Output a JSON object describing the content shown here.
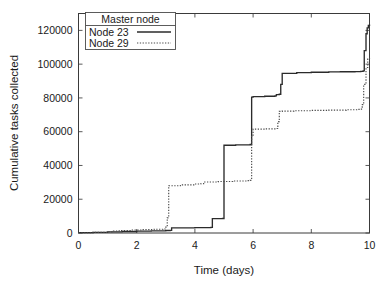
{
  "chart_data": {
    "type": "line",
    "title": "",
    "xlabel": "Time (days)",
    "ylabel": "Cumulative tasks collected",
    "xlim": [
      0,
      10
    ],
    "ylim": [
      0,
      130000
    ],
    "xticks": [
      0,
      2,
      4,
      6,
      8,
      10
    ],
    "xtick_labels": [
      "0",
      "2",
      "4",
      "6",
      "8",
      "10"
    ],
    "yticks": [
      0,
      20000,
      40000,
      60000,
      80000,
      100000,
      120000
    ],
    "ytick_labels": [
      "0",
      "20000",
      "40000",
      "60000",
      "80000",
      "100000",
      "120000"
    ],
    "grid": false,
    "step_style": "post",
    "legend": {
      "title": "Master node",
      "position": "upper-left-inside",
      "entries": [
        {
          "label": "Node 23",
          "style": "solid"
        },
        {
          "label": "Node 29",
          "style": "dotted"
        }
      ]
    },
    "series": [
      {
        "name": "Node 23",
        "style": "solid",
        "color": "#2b2b2b",
        "x": [
          0.0,
          0.5,
          1.0,
          1.5,
          2.0,
          2.5,
          3.0,
          3.15,
          3.2,
          4.0,
          4.55,
          4.6,
          4.95,
          5.0,
          5.4,
          5.9,
          5.95,
          6.0,
          6.4,
          6.75,
          6.8,
          6.9,
          6.95,
          7.0,
          7.5,
          8.0,
          8.6,
          9.0,
          9.5,
          9.7,
          9.78,
          9.82,
          9.88,
          9.92,
          9.96,
          10.0
        ],
        "y": [
          200,
          400,
          700,
          900,
          1100,
          1300,
          1500,
          1600,
          3000,
          3200,
          3300,
          8500,
          8600,
          52000,
          52200,
          52400,
          80500,
          80800,
          81000,
          81200,
          82000,
          82200,
          88000,
          94500,
          95000,
          95200,
          95400,
          95500,
          95600,
          95700,
          96000,
          108000,
          118000,
          121500,
          123000,
          123500
        ]
      },
      {
        "name": "Node 29",
        "style": "dotted",
        "color": "#4a4a4a",
        "x": [
          0.0,
          0.5,
          1.0,
          1.2,
          1.4,
          1.8,
          2.2,
          2.6,
          2.9,
          3.0,
          3.05,
          3.1,
          3.5,
          4.0,
          4.2,
          4.3,
          4.8,
          5.3,
          5.8,
          5.9,
          5.95,
          6.0,
          6.4,
          6.8,
          6.85,
          6.9,
          7.0,
          7.4,
          8.0,
          8.6,
          9.2,
          9.6,
          9.7,
          9.75,
          9.8,
          9.88,
          9.94,
          10.0
        ],
        "y": [
          150,
          400,
          700,
          1200,
          1500,
          1800,
          2000,
          2200,
          2400,
          3500,
          9000,
          28000,
          28500,
          29000,
          29200,
          30200,
          30500,
          30800,
          31000,
          31200,
          58000,
          61500,
          61700,
          61900,
          66000,
          72000,
          72200,
          72400,
          72600,
          72800,
          73000,
          73200,
          73400,
          76000,
          88000,
          98000,
          103000,
          104000
        ]
      }
    ]
  }
}
